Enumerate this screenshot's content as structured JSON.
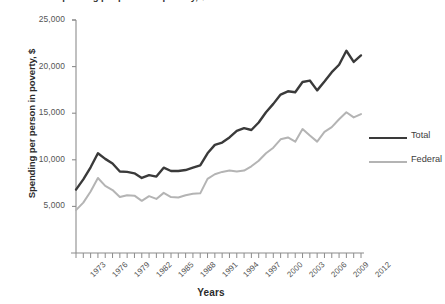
{
  "chart_data": {
    "type": "line",
    "title": "Spending per person in poverty, $",
    "xlabel": "Years",
    "ylabel": "Spending per person in poverty, $",
    "xlim": [
      1973,
      2012
    ],
    "ylim": [
      0,
      25000
    ],
    "y_ticks": [
      5000,
      10000,
      15000,
      20000,
      25000
    ],
    "y_tick_labels": [
      "5,000",
      "10,000",
      "15,000",
      "20,000",
      "25,000"
    ],
    "x_ticks": [
      1973,
      1976,
      1979,
      1982,
      1985,
      1988,
      1991,
      1994,
      1997,
      2000,
      2003,
      2006,
      2009,
      2012
    ],
    "x_tick_labels": [
      "1973",
      "1976",
      "1979",
      "1982",
      "1985",
      "1988",
      "1991",
      "1994",
      "1997",
      "2000",
      "2003",
      "2006",
      "2009",
      "2012"
    ],
    "x_minor_tick_interval": 1,
    "grid": false,
    "legend_position": "right",
    "x": [
      1973,
      1974,
      1975,
      1976,
      1977,
      1978,
      1979,
      1980,
      1981,
      1982,
      1983,
      1984,
      1985,
      1986,
      1987,
      1988,
      1989,
      1990,
      1991,
      1992,
      1993,
      1994,
      1995,
      1996,
      1997,
      1998,
      1999,
      2000,
      2001,
      2002,
      2003,
      2004,
      2005,
      2006,
      2007,
      2008,
      2009,
      2010,
      2011,
      2012
    ],
    "series": [
      {
        "name": "Total",
        "color": "#3a3a3a",
        "values": [
          6800,
          7900,
          9200,
          10700,
          10100,
          9600,
          8750,
          8700,
          8550,
          8050,
          8350,
          8200,
          9150,
          8800,
          8800,
          8900,
          9150,
          9400,
          10700,
          11600,
          11850,
          12400,
          13100,
          13400,
          13200,
          14000,
          15100,
          16000,
          17000,
          17350,
          17250,
          18350,
          18500,
          17450,
          18400,
          19400,
          20200,
          21700,
          20500,
          21200
        ]
      },
      {
        "name": "Federal",
        "color": "#b4b4b4",
        "values": [
          4600,
          5400,
          6600,
          8050,
          7200,
          6750,
          6000,
          6200,
          6150,
          5600,
          6100,
          5800,
          6450,
          6000,
          5950,
          6200,
          6350,
          6400,
          7950,
          8450,
          8700,
          8850,
          8750,
          8850,
          9300,
          9900,
          10700,
          11300,
          12200,
          12400,
          11950,
          13300,
          12600,
          11950,
          13000,
          13500,
          14350,
          15100,
          14550,
          14900
        ]
      }
    ]
  },
  "legend": {
    "items": [
      {
        "label": "Total",
        "color": "#3a3a3a",
        "width": 2.4
      },
      {
        "label": "Federal",
        "color": "#b4b4b4",
        "width": 2.0
      }
    ]
  },
  "axes": {
    "x_title": "Years",
    "y_title": "Spending per person in poverty, $",
    "axis_color": "#8c8c8c"
  }
}
